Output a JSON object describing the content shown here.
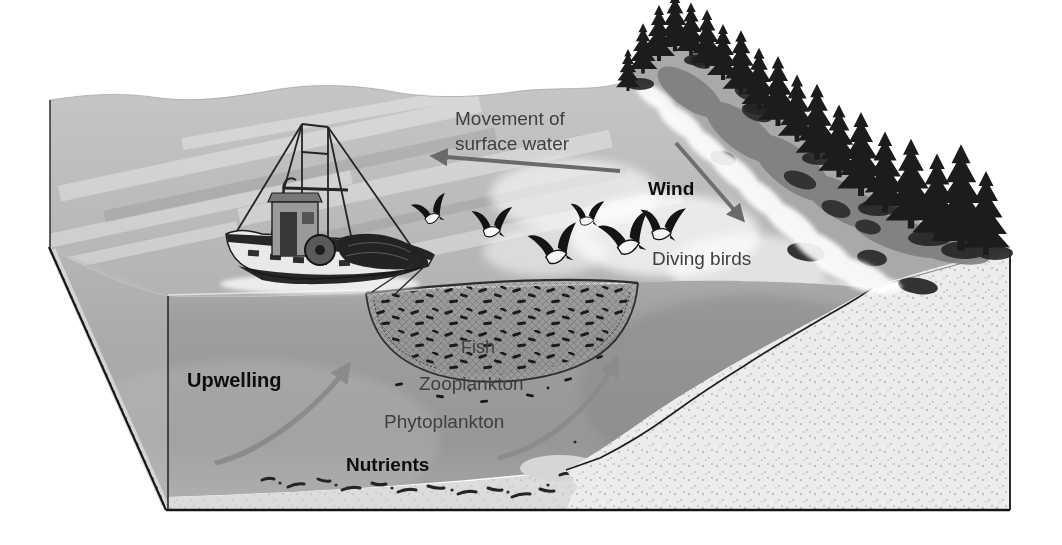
{
  "figure": {
    "name": "coastal-upwelling-diagram",
    "type": "textbook block illustration",
    "background": "#ffffff"
  },
  "labels": {
    "surface_movement": "Movement of surface water",
    "wind": "Wind",
    "diving_birds": "Diving birds",
    "fish": "Fish",
    "zooplankton": "Zooplankton",
    "phytoplankton": "Phytoplankton",
    "nutrients": "Nutrients",
    "upwelling": "Upwelling"
  },
  "arrows": [
    {
      "name": "surface-water-arrow",
      "direction": "left",
      "for_label": "Movement of surface water"
    },
    {
      "name": "wind-arrow",
      "direction": "down-right toward shore",
      "for_label": "Wind"
    },
    {
      "name": "upwelling-arrow-left",
      "direction": "curving up-right from seafloor",
      "for_label": "Upwelling"
    },
    {
      "name": "upwelling-arrow-right",
      "direction": "curving up-right along slope",
      "for_label": "Upwelling"
    }
  ],
  "scene_elements": [
    "fishing-boat",
    "seine-net",
    "fish-school",
    "diving-birds",
    "sea-surface",
    "water-column-cross-section",
    "continental-slope-sand",
    "seafloor-sediment",
    "coastal-hill",
    "conifer-forest",
    "shore-rocks",
    "surf-foam"
  ],
  "colors": {
    "sea_surface": "#bdbdbd",
    "water_column": "#9b9b9b",
    "sand_face": "#ececec",
    "hillside": "#a9a9a9",
    "trees": "#1c1c1c",
    "label_arrow": "#6a6a6a",
    "upwelling_arrow": "#8b8b8b",
    "label_text": "#3f3f3f",
    "bold_label_text": "#0d0d0d"
  }
}
